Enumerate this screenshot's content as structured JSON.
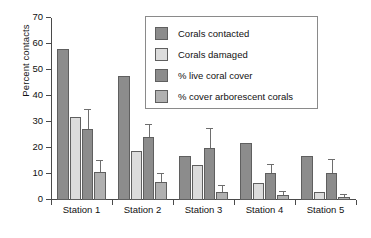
{
  "chart_data": {
    "type": "bar",
    "title": "",
    "xlabel": "",
    "ylabel": "Percent contacts",
    "ylim": [
      0,
      70
    ],
    "yticks": [
      0,
      10,
      20,
      30,
      40,
      50,
      60,
      70
    ],
    "ytick_labels": [
      "0",
      "10",
      "20",
      "30",
      "40",
      "50",
      "60",
      "70"
    ],
    "grid": false,
    "legend_position": "top-center",
    "categories": [
      "Station 1",
      "Station 2",
      "Station 3",
      "Station 4",
      "Station 5"
    ],
    "series": [
      {
        "name": "Corals contacted",
        "color": "#8c8c8c",
        "values": [
          58.2,
          47.6,
          17.0,
          22.1,
          17.1
        ],
        "errors": [
          null,
          null,
          null,
          null,
          null
        ]
      },
      {
        "name": "Corals damaged",
        "color": "#dcdcdc",
        "values": [
          31.8,
          18.9,
          13.3,
          6.4,
          3.2
        ],
        "errors": [
          null,
          null,
          null,
          null,
          null
        ]
      },
      {
        "name": "% live coral cover",
        "color": "#8c8c8c",
        "values": [
          27.5,
          24.4,
          20.1,
          10.3,
          10.2
        ],
        "errors": [
          7.0,
          4.5,
          7.4,
          3.3,
          5.2
        ]
      },
      {
        "name": "% cover arborescent corals",
        "color": "#b0b0b0",
        "values": [
          10.6,
          7.0,
          2.9,
          1.8,
          1.2
        ],
        "errors": [
          4.4,
          3.0,
          2.5,
          1.1,
          0.9
        ]
      }
    ]
  },
  "legend": {
    "items": [
      {
        "label": "Corals contacted"
      },
      {
        "label": "Corals damaged"
      },
      {
        "label": "% live coral cover"
      },
      {
        "label": "% cover arborescent corals"
      }
    ]
  }
}
